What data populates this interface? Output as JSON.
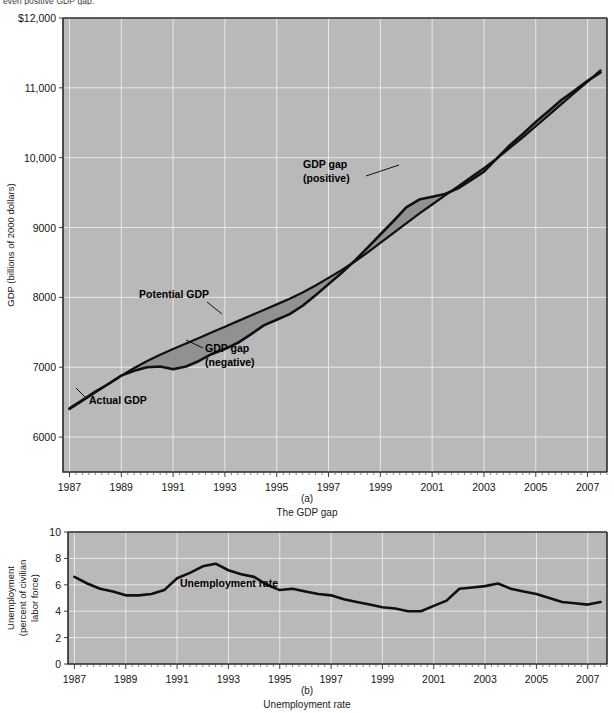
{
  "page": {
    "top_cut_text": "even positive GDP gap.",
    "background_color": "#ffffff",
    "plot_background_color": "#b9b9b9",
    "gridline_color": "#e8e8e8",
    "line_color": "#101010",
    "gap_fill_color": "#8e8e8e"
  },
  "panel_a": {
    "caption_letter": "(a)",
    "caption_title": "The GDP gap",
    "ylabel": "GDP (billions of 2000 dollars)",
    "annotations": {
      "actual_gdp": "Actual GDP",
      "potential_gdp": "Potential GDP",
      "gap_negative_line1": "GDP gap",
      "gap_negative_line2": "(negative)",
      "gap_positive_line1": "GDP gap",
      "gap_positive_line2": "(positive)"
    }
  },
  "panel_b": {
    "caption_letter": "(b)",
    "caption_title": "Unemployment rate",
    "ylabel_line1": "Unemployment",
    "ylabel_line2": "(percent of civilian",
    "ylabel_line3": "labor force)",
    "annotations": {
      "series": "Unemployment rate"
    }
  },
  "chart_data": [
    {
      "type": "area",
      "id": "gdp-gap",
      "title": "The GDP gap",
      "xlabel": "",
      "ylabel": "GDP (billions of 2000 dollars)",
      "xlim": [
        1986.75,
        2007.75
      ],
      "ylim": [
        5500,
        12000
      ],
      "ytick_labels": [
        "$12,000",
        "11,000",
        "10,000",
        "9000",
        "8000",
        "7000",
        "6000"
      ],
      "yticks": [
        12000,
        11000,
        10000,
        9000,
        8000,
        7000,
        6000
      ],
      "xticks": [
        1987,
        1989,
        1991,
        1993,
        1995,
        1997,
        1999,
        2001,
        2003,
        2005,
        2007
      ],
      "xtick_labels": [
        "1987",
        "1989",
        "1991",
        "1993",
        "1995",
        "1997",
        "1999",
        "2001",
        "2003",
        "2005",
        "2007"
      ],
      "minor_tick_interval": 0.25,
      "grid": true,
      "legend": "none",
      "x": [
        1987.0,
        1987.5,
        1988.0,
        1988.5,
        1989.0,
        1989.5,
        1990.0,
        1990.5,
        1991.0,
        1991.5,
        1992.0,
        1992.5,
        1993.0,
        1993.5,
        1994.0,
        1994.5,
        1995.0,
        1995.5,
        1996.0,
        1996.5,
        1997.0,
        1997.5,
        1998.0,
        1998.5,
        1999.0,
        1999.5,
        2000.0,
        2000.5,
        2001.0,
        2001.5,
        2002.0,
        2002.5,
        2003.0,
        2003.5,
        2004.0,
        2004.5,
        2005.0,
        2005.5,
        2006.0,
        2006.5,
        2007.0,
        2007.5
      ],
      "series": [
        {
          "name": "Actual GDP",
          "values": [
            6410,
            6530,
            6650,
            6760,
            6880,
            6950,
            7000,
            7010,
            6970,
            7010,
            7090,
            7190,
            7260,
            7350,
            7470,
            7600,
            7680,
            7760,
            7880,
            8030,
            8190,
            8350,
            8520,
            8710,
            8900,
            9090,
            9290,
            9400,
            9440,
            9480,
            9560,
            9680,
            9800,
            9990,
            10180,
            10340,
            10510,
            10670,
            10830,
            10960,
            11100,
            11220
          ]
        },
        {
          "name": "Potential GDP",
          "values": [
            6400,
            6520,
            6640,
            6760,
            6880,
            6990,
            7090,
            7180,
            7260,
            7340,
            7420,
            7500,
            7580,
            7660,
            7740,
            7820,
            7900,
            7980,
            8070,
            8170,
            8280,
            8390,
            8510,
            8640,
            8780,
            8920,
            9060,
            9200,
            9330,
            9460,
            9590,
            9720,
            9850,
            9990,
            10140,
            10290,
            10450,
            10610,
            10770,
            10930,
            11090,
            11250
          ]
        }
      ]
    },
    {
      "type": "line",
      "id": "unemployment-rate",
      "title": "Unemployment rate",
      "xlabel": "",
      "ylabel": "Unemployment (percent of civilian labor force)",
      "xlim": [
        1986.75,
        2007.75
      ],
      "ylim": [
        0,
        10
      ],
      "yticks": [
        0,
        2,
        4,
        6,
        8,
        10
      ],
      "ytick_labels": [
        "0",
        "2",
        "4",
        "6",
        "8",
        "10"
      ],
      "xticks": [
        1987,
        1989,
        1991,
        1993,
        1995,
        1997,
        1999,
        2001,
        2003,
        2005,
        2007
      ],
      "xtick_labels": [
        "1987",
        "1989",
        "1991",
        "1993",
        "1995",
        "1997",
        "1999",
        "2001",
        "2003",
        "2005",
        "2007"
      ],
      "minor_tick_interval": 0.25,
      "grid": true,
      "legend": "none",
      "x": [
        1987.0,
        1987.5,
        1988.0,
        1988.5,
        1989.0,
        1989.5,
        1990.0,
        1990.5,
        1991.0,
        1991.5,
        1992.0,
        1992.5,
        1993.0,
        1993.5,
        1994.0,
        1994.5,
        1995.0,
        1995.5,
        1996.0,
        1996.5,
        1997.0,
        1997.5,
        1998.0,
        1998.5,
        1999.0,
        1999.5,
        2000.0,
        2000.5,
        2001.0,
        2001.5,
        2002.0,
        2002.5,
        2003.0,
        2003.5,
        2004.0,
        2004.5,
        2005.0,
        2005.5,
        2006.0,
        2006.5,
        2007.0,
        2007.5
      ],
      "series": [
        {
          "name": "Unemployment rate",
          "values": [
            6.6,
            6.1,
            5.7,
            5.5,
            5.2,
            5.2,
            5.3,
            5.6,
            6.5,
            6.9,
            7.4,
            7.6,
            7.1,
            6.8,
            6.6,
            6.0,
            5.6,
            5.7,
            5.5,
            5.3,
            5.2,
            4.9,
            4.7,
            4.5,
            4.3,
            4.2,
            4.0,
            4.0,
            4.4,
            4.8,
            5.7,
            5.8,
            5.9,
            6.1,
            5.7,
            5.5,
            5.3,
            5.0,
            4.7,
            4.6,
            4.5,
            4.7
          ]
        }
      ]
    }
  ]
}
